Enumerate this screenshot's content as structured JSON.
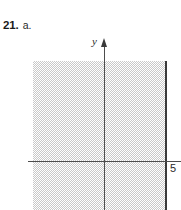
{
  "problem": {
    "number": "21.",
    "part": "a."
  },
  "figure": {
    "axis_y_label": "y",
    "axis_y_arrow_icon": "up-arrowhead-icon",
    "tick_label_x5": "5",
    "shading_color": "#c9c9c9",
    "boundary_color": "#3a3a3a",
    "axis_color": "#4d4d4d"
  },
  "chart_data": {
    "type": "area",
    "title": "",
    "subtitle": "",
    "xlabel": "",
    "ylabel": "y",
    "grid": false,
    "legend": null,
    "xlim": [
      -4.2,
      7.5
    ],
    "ylim": [
      -2.1,
      5.4
    ],
    "xticks": [
      5
    ],
    "xticklabels": [
      "5"
    ],
    "yticks": [],
    "yticklabels": [],
    "axes": [
      {
        "name": "y-axis",
        "orientation": "vertical",
        "at": 0,
        "arrow": "up",
        "label": "y"
      },
      {
        "name": "x-axis",
        "orientation": "horizontal",
        "at": 0,
        "arrow": "none",
        "label": ""
      }
    ],
    "annotations": [
      {
        "text": "5",
        "x": 5,
        "y": -0.35,
        "role": "x-intercept-tick-label"
      }
    ],
    "series": [
      {
        "name": "solution-region",
        "kind": "half-plane",
        "inequality": "x <= 5",
        "shaded_side": "left",
        "boundary": {
          "type": "vertical-line",
          "x": 5,
          "style": "solid",
          "included": true
        },
        "fill": "halftone-gray",
        "fill_color": "#c9c9c9",
        "extent": {
          "x_from": "-infinity",
          "x_to": 5,
          "y_from": "-infinity",
          "y_to": "+infinity"
        }
      }
    ]
  }
}
